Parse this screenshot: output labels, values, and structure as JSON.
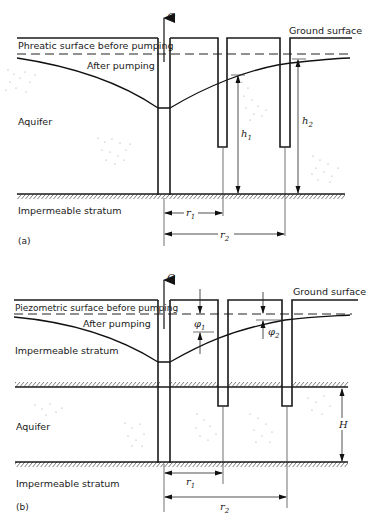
{
  "figure_a": {
    "panel_label": "(a)",
    "flow_label": "Q",
    "ground_surface": "Ground surface",
    "before_label": "Phreatic surface before pumping",
    "after_label": "After pumping",
    "aquifer_label": "Aquifer",
    "bottom_label": "Impermeable stratum",
    "h1": "h",
    "h1_sub": "1",
    "h2": "h",
    "h2_sub": "2",
    "r1": "r",
    "r1_sub": "1",
    "r2": "r",
    "r2_sub": "2"
  },
  "figure_b": {
    "panel_label": "(b)",
    "flow_label": "Q",
    "ground_surface": "Ground surface",
    "before_label": "Piezometric surface before pumping",
    "after_label": "After pumping",
    "top_stratum_label": "Impermeable stratum",
    "aquifer_label": "Aquifer",
    "bottom_label": "Impermeable stratum",
    "phi1": "φ",
    "phi1_sub": "1",
    "phi2": "φ",
    "phi2_sub": "2",
    "thickness": "H",
    "r1": "r",
    "r1_sub": "1",
    "r2": "r",
    "r2_sub": "2"
  }
}
